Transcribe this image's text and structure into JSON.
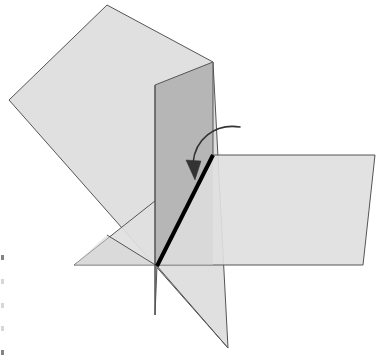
{
  "figure": {
    "background_color": "#ffffff"
  },
  "colors": {
    "plane_light_fill": "#e0e0e0",
    "plane_mid_fill": "#d6d6d6",
    "plane_dark_fill": "#b6b6b6",
    "plane_overlap_fill": "#cfcfcf",
    "edge_stroke": "#555555",
    "fold_edge_stroke": "#000000",
    "arrow_stroke": "#333333",
    "margin_mark": "#9a9a9a"
  },
  "shapes": {
    "tilted_square_plane": {
      "name": "tilted-square-plane",
      "points": "107,5 213,62 228,348 9,100",
      "fill": "#e0e0e0",
      "stroke": "#555555",
      "stroke_width": 1
    },
    "horizontal_plane": {
      "name": "horizontal-plane",
      "points": "213,155 375,155 363,265 74,265",
      "fill": "#e0e0e0",
      "stroke": "#555555",
      "stroke_width": 1
    },
    "vertical_plane": {
      "name": "vertical-half-plane",
      "points": "155,85 213,62 213,155 157,266 155,315",
      "fill": "#b6b6b6",
      "stroke": "#555555",
      "stroke_width": 1
    },
    "fold_edge": {
      "name": "fold-edge-line",
      "from_x": 213,
      "from_y": 155,
      "to_x": 157,
      "to_y": 266,
      "stroke": "#000000",
      "stroke_width": 4
    },
    "rotation_arrow": {
      "name": "rotation-arrow",
      "path": "M 240,127 C 215,124 196,140 193,164",
      "arrowhead": "187,162 200,163 194,180",
      "stroke": "#333333",
      "stroke_width": 1.6
    }
  },
  "intersection_point": {
    "label": "apex",
    "x": 157,
    "y": 266
  },
  "margin_marks": {
    "count": 5,
    "note": "faint cropped text fragments at left page margin"
  }
}
